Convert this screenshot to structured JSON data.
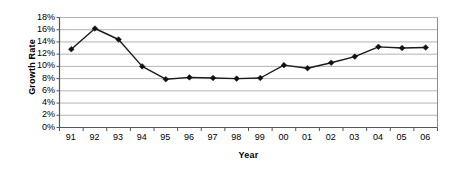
{
  "chart_data": {
    "type": "line",
    "title": "",
    "xlabel": "Year",
    "ylabel": "Growth Rate",
    "categories": [
      "91",
      "92",
      "93",
      "94",
      "95",
      "96",
      "97",
      "98",
      "99",
      "00",
      "01",
      "02",
      "03",
      "04",
      "05",
      "06"
    ],
    "values": [
      12.8,
      16.2,
      14.4,
      10.0,
      7.9,
      8.2,
      8.1,
      8.0,
      8.1,
      10.2,
      9.7,
      10.6,
      11.6,
      13.2,
      13.0,
      13.1
    ],
    "ylim": [
      0,
      18
    ],
    "ytick_values": [
      0,
      2,
      4,
      6,
      8,
      10,
      12,
      14,
      16,
      18
    ],
    "ytick_labels": [
      "0%",
      "2%",
      "4%",
      "6%",
      "8%",
      "10%",
      "12%",
      "14%",
      "16%",
      "18%"
    ],
    "ytick_suffix": "%",
    "grid": true,
    "grid_axis": "y",
    "legend": false,
    "legend_position": "none",
    "series": [
      {
        "name": "Growth Rate",
        "values": [
          12.8,
          16.2,
          14.4,
          10.0,
          7.9,
          8.2,
          8.1,
          8.0,
          8.1,
          10.2,
          9.7,
          10.6,
          11.6,
          13.2,
          13.0,
          13.1
        ]
      }
    ],
    "colors": {
      "line": "#1a1a1a",
      "marker": "#111111",
      "grid": "#b3b3b3",
      "frame": "#8c8c8c",
      "axis": "#555555",
      "background": "#ffffff",
      "text": "#000000"
    },
    "marker": "diamond",
    "annotations": []
  },
  "axis_titles": {
    "y": "Growth Rate",
    "x": "Year"
  }
}
